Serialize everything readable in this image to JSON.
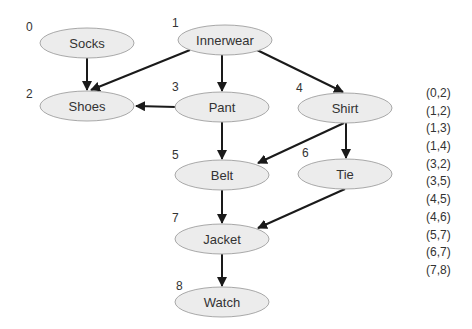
{
  "graph": {
    "nodes": [
      {
        "id": 0,
        "index_label": "0",
        "label": "Socks",
        "cx": 87,
        "cy": 43
      },
      {
        "id": 1,
        "index_label": "1",
        "label": "Innerwear",
        "cx": 225,
        "cy": 40
      },
      {
        "id": 2,
        "index_label": "2",
        "label": "Shoes",
        "cx": 87,
        "cy": 106
      },
      {
        "id": 3,
        "index_label": "3",
        "label": "Pant",
        "cx": 222,
        "cy": 107
      },
      {
        "id": 4,
        "index_label": "4",
        "label": "Shirt",
        "cx": 345,
        "cy": 108
      },
      {
        "id": 5,
        "index_label": "5",
        "label": "Belt",
        "cx": 222,
        "cy": 175
      },
      {
        "id": 6,
        "index_label": "6",
        "label": "Tie",
        "cx": 345,
        "cy": 174
      },
      {
        "id": 7,
        "index_label": "7",
        "label": "Jacket",
        "cx": 222,
        "cy": 239
      },
      {
        "id": 8,
        "index_label": "8",
        "label": "Watch",
        "cx": 222,
        "cy": 302
      }
    ],
    "edges": [
      {
        "from": 0,
        "to": 2
      },
      {
        "from": 1,
        "to": 2
      },
      {
        "from": 1,
        "to": 3
      },
      {
        "from": 1,
        "to": 4
      },
      {
        "from": 3,
        "to": 2
      },
      {
        "from": 3,
        "to": 5
      },
      {
        "from": 4,
        "to": 5
      },
      {
        "from": 4,
        "to": 6
      },
      {
        "from": 5,
        "to": 7
      },
      {
        "from": 6,
        "to": 7
      },
      {
        "from": 7,
        "to": 8
      }
    ]
  },
  "edge_list": [
    "(0,2)",
    "(1,2)",
    "(1,3)",
    "(1,4)",
    "(3,2)",
    "(3,5)",
    "(4,5)",
    "(4,6)",
    "(5,7)",
    "(6,7)",
    "(7,8)"
  ],
  "colors": {
    "node_fill": "#ececec",
    "node_stroke": "#a8a8a8",
    "edge": "#1a1a1a",
    "text": "#333333"
  }
}
